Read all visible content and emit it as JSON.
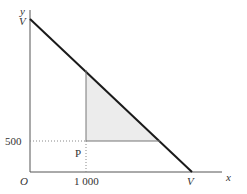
{
  "axes": {
    "x_label": "x",
    "y_label": "y",
    "origin_label": "O"
  },
  "labels": {
    "y_intercept": "V",
    "x_intercept": "V",
    "x_tick": "1 000",
    "y_tick": "500",
    "point": "P"
  },
  "colors": {
    "line": "#1a1a1a",
    "axis": "#555555",
    "shade": "#ececec"
  }
}
